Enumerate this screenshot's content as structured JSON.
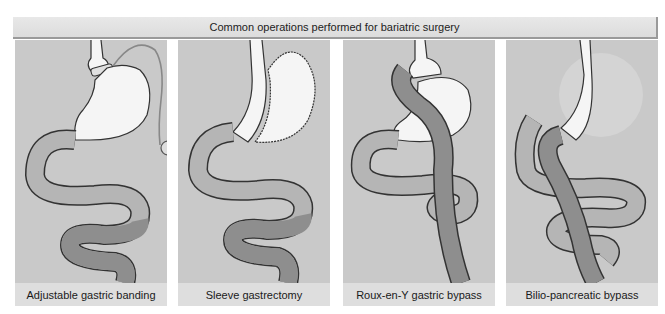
{
  "header": {
    "title": "Common operations performed for bariatric surgery"
  },
  "colors": {
    "background": "#c9c9c9",
    "label_strip": "#dedede",
    "stomach": "#f5f5f5",
    "intestine_light": "#b5b5b5",
    "intestine_dark": "#8e8e8e",
    "outline": "#333333"
  },
  "panels": [
    {
      "label": "Adjustable gastric banding"
    },
    {
      "label": "Sleeve gastrectomy"
    },
    {
      "label": "Roux-en-Y gastric bypass"
    },
    {
      "label": "Bilio-pancreatic bypass"
    }
  ]
}
